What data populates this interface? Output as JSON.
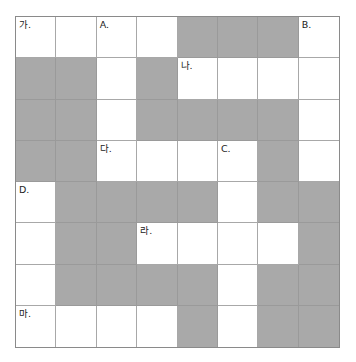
{
  "puzzle": {
    "rows": 8,
    "cols": 8,
    "colors": {
      "blank": "#ffffff",
      "shaded": "#a9a9a9",
      "grid_line": "#a8a8a8",
      "label_text": "#222222"
    },
    "grid": [
      [
        "W",
        "W",
        "W",
        "W",
        "S",
        "S",
        "S",
        "W"
      ],
      [
        "S",
        "S",
        "W",
        "S",
        "W",
        "W",
        "W",
        "W"
      ],
      [
        "S",
        "S",
        "W",
        "S",
        "S",
        "S",
        "S",
        "W"
      ],
      [
        "S",
        "S",
        "W",
        "W",
        "W",
        "W",
        "S",
        "W"
      ],
      [
        "W",
        "S",
        "S",
        "S",
        "S",
        "W",
        "S",
        "S"
      ],
      [
        "W",
        "S",
        "S",
        "W",
        "W",
        "W",
        "W",
        "S"
      ],
      [
        "W",
        "S",
        "S",
        "S",
        "S",
        "W",
        "S",
        "S"
      ],
      [
        "W",
        "W",
        "W",
        "W",
        "S",
        "W",
        "S",
        "S"
      ]
    ],
    "clue_labels": [
      {
        "row": 0,
        "col": 0,
        "text": "가."
      },
      {
        "row": 0,
        "col": 2,
        "text": "A."
      },
      {
        "row": 0,
        "col": 7,
        "text": "B."
      },
      {
        "row": 1,
        "col": 4,
        "text": "나."
      },
      {
        "row": 3,
        "col": 2,
        "text": "다."
      },
      {
        "row": 3,
        "col": 5,
        "text": "C."
      },
      {
        "row": 4,
        "col": 0,
        "text": "D."
      },
      {
        "row": 5,
        "col": 3,
        "text": "라."
      },
      {
        "row": 7,
        "col": 0,
        "text": "마."
      }
    ]
  }
}
